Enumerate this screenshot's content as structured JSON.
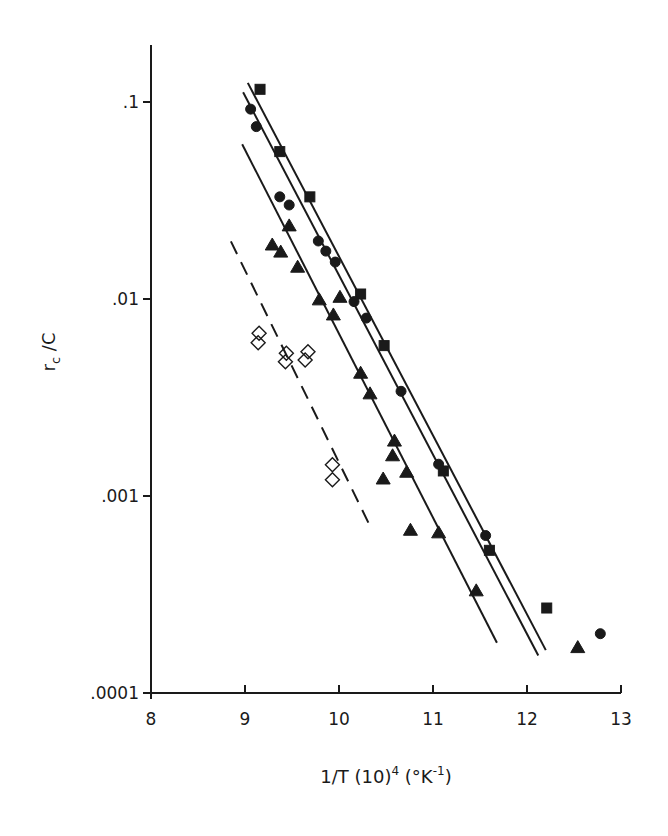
{
  "chart_data": {
    "type": "scatter",
    "title": "",
    "xlabel": "1/T (10)^4 (°K^-1)",
    "xlabel_parts": {
      "main": "1/T  (10)",
      "sup1": "4",
      "mid": " (°K",
      "sup2": "-1",
      "end": ")"
    },
    "ylabel": "r_c / C",
    "ylabel_parts": {
      "r": "r",
      "sub": "c",
      "rest": " /C"
    },
    "xlim": [
      8,
      13
    ],
    "ylim": [
      0.0001,
      0.2
    ],
    "yscale": "log",
    "grid": false,
    "legend": null,
    "x_ticks": [
      {
        "value": 8,
        "label": "8"
      },
      {
        "value": 9,
        "label": "9"
      },
      {
        "value": 10,
        "label": "10"
      },
      {
        "value": 11,
        "label": "11"
      },
      {
        "value": 12,
        "label": "12"
      },
      {
        "value": 13,
        "label": "13"
      }
    ],
    "y_ticks": [
      {
        "value": 0.1,
        "label": ".1"
      },
      {
        "value": 0.01,
        "label": ".01"
      },
      {
        "value": 0.001,
        "label": ".001"
      },
      {
        "value": 0.0001,
        "label": ".0001"
      }
    ],
    "series": [
      {
        "name": "filled squares",
        "marker": "square",
        "filled": true,
        "color": "#1a1a1a",
        "points": [
          [
            9.16,
            0.116
          ],
          [
            9.37,
            0.056
          ],
          [
            9.69,
            0.033
          ],
          [
            10.23,
            0.0106
          ],
          [
            10.48,
            0.0058
          ],
          [
            11.11,
            0.00134
          ],
          [
            11.6,
            0.00053
          ],
          [
            12.21,
            0.00027
          ]
        ],
        "fit_line": {
          "style": "solid",
          "from": [
            9.03,
            0.125
          ],
          "to": [
            12.2,
            0.000165
          ]
        }
      },
      {
        "name": "filled circles",
        "marker": "circle",
        "filled": true,
        "color": "#1a1a1a",
        "points": [
          [
            9.06,
            0.092
          ],
          [
            9.12,
            0.075
          ],
          [
            9.37,
            0.033
          ],
          [
            9.47,
            0.03
          ],
          [
            9.78,
            0.0197
          ],
          [
            9.86,
            0.0175
          ],
          [
            9.96,
            0.0154
          ],
          [
            10.16,
            0.0097
          ],
          [
            10.29,
            0.008
          ],
          [
            10.66,
            0.0034
          ],
          [
            11.06,
            0.00145
          ],
          [
            11.56,
            0.00063
          ],
          [
            12.78,
            0.0002
          ]
        ],
        "fit_line": {
          "style": "solid",
          "from": [
            8.98,
            0.112
          ],
          "to": [
            12.12,
            0.000155
          ]
        }
      },
      {
        "name": "filled triangles",
        "marker": "triangle",
        "filled": true,
        "color": "#1a1a1a",
        "points": [
          [
            9.29,
            0.0188
          ],
          [
            9.38,
            0.0173
          ],
          [
            9.47,
            0.0235
          ],
          [
            9.56,
            0.0145
          ],
          [
            9.79,
            0.0099
          ],
          [
            10.01,
            0.0102
          ],
          [
            9.94,
            0.0083
          ],
          [
            10.23,
            0.0042
          ],
          [
            10.33,
            0.0033
          ],
          [
            10.59,
            0.0019
          ],
          [
            10.57,
            0.0016
          ],
          [
            10.47,
            0.00122
          ],
          [
            10.72,
            0.00132
          ],
          [
            10.76,
            0.00067
          ],
          [
            11.06,
            0.00065
          ],
          [
            11.46,
            0.00033
          ],
          [
            12.54,
            0.00017
          ]
        ],
        "fit_line": {
          "style": "solid",
          "from": [
            8.97,
            0.061
          ],
          "to": [
            11.68,
            0.00018
          ]
        }
      },
      {
        "name": "open diamonds",
        "marker": "diamond",
        "filled": false,
        "color": "#1a1a1a",
        "points": [
          [
            9.15,
            0.0067
          ],
          [
            9.14,
            0.006
          ],
          [
            9.44,
            0.0053
          ],
          [
            9.43,
            0.0048
          ],
          [
            9.67,
            0.0054
          ],
          [
            9.64,
            0.0049
          ],
          [
            9.93,
            0.00144
          ],
          [
            9.93,
            0.00121
          ]
        ],
        "fit_line": {
          "style": "dashed",
          "from": [
            8.85,
            0.0196
          ],
          "to": [
            10.32,
            0.00072
          ]
        }
      }
    ]
  },
  "layout": {
    "plot_left": 151,
    "plot_bottom": 693,
    "x_axis_right": 621,
    "y_axis_top": 45,
    "px_per_x_unit": 94,
    "px_per_decade": 197
  }
}
